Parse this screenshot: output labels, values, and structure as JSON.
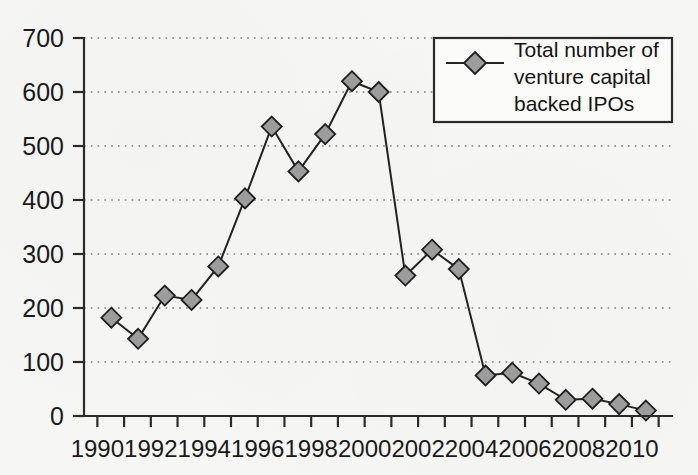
{
  "chart_data": {
    "type": "line",
    "title": "",
    "xlabel": "",
    "ylabel": "",
    "grid": true,
    "legend_position": "top-right",
    "xlim": [
      1989.5,
      2011.5
    ],
    "ylim": [
      0,
      700
    ],
    "yticks": [
      0,
      100,
      200,
      300,
      400,
      500,
      600,
      700
    ],
    "xticks": [
      1990,
      1991,
      1992,
      1993,
      1994,
      1995,
      1996,
      1997,
      1998,
      1999,
      2000,
      2001,
      2002,
      2003,
      2004,
      2005,
      2006,
      2007,
      2008,
      2009,
      2010,
      2011
    ],
    "xtick_labels": [
      "1990",
      "1992",
      "1994",
      "1996",
      "1998",
      "2000",
      "2002",
      "2004",
      "2006",
      "2008",
      "2010"
    ],
    "xtick_labels_years": [
      1990,
      1992,
      1994,
      1996,
      1998,
      2000,
      2002,
      2004,
      2006,
      2008,
      2010
    ],
    "series": [
      {
        "name": "Total number of venture capital backed IPOs",
        "marker": "diamond",
        "marker_color": "#9c9c9c",
        "line_color": "#232323",
        "x": [
          1990,
          1991,
          1992,
          1993,
          1994,
          1995,
          1996,
          1997,
          1998,
          1999,
          2000,
          2001,
          2002,
          2003,
          2004,
          2005,
          2006,
          2007,
          2008,
          2009,
          2010
        ],
        "values": [
          182,
          143,
          223,
          215,
          277,
          403,
          536,
          453,
          522,
          620,
          600,
          260,
          308,
          272,
          75,
          80,
          60,
          30,
          32,
          22,
          10
        ]
      }
    ]
  },
  "legend": {
    "entries": [
      {
        "lines": [
          "Total number of",
          "venture capital",
          "backed IPOs"
        ],
        "marker": "diamond-marker"
      }
    ]
  },
  "axis": {
    "y_labels": [
      "700",
      "600",
      "500",
      "400",
      "300",
      "200",
      "100",
      "0"
    ],
    "x_labels": [
      "1990",
      "1992",
      "1994",
      "1996",
      "1998",
      "2000",
      "2002",
      "2004",
      "2006",
      "2008",
      "2010"
    ]
  },
  "colors": {
    "background": "#f6f6f5",
    "axis": "#2b2b2b",
    "grid": "#7d7d7d",
    "line": "#232323",
    "marker_fill": "#9c9c9c",
    "marker_stroke": "#1f1f1f",
    "text": "#1a1a1a"
  }
}
